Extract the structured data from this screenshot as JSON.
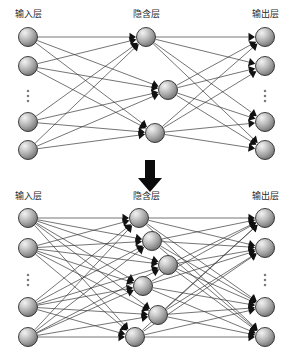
{
  "figure": {
    "background_color": "#ffffff",
    "node_fill_color": "#9e9e9e",
    "node_highlight_color": "#e8e8e8",
    "node_stroke_color": "#2a2a2a",
    "edge_color": "#3a3a3a",
    "arrow_color": "#111111",
    "label_color": "#2b2b2b"
  },
  "labels": {
    "input_layer": "输入层",
    "hidden_layer": "隐含层",
    "output_layer": "输出层",
    "ellipsis": "⋮"
  },
  "transition": {
    "icon": "down-arrow-icon",
    "direction": "down"
  },
  "chart_data": {
    "type": "diagram",
    "panels": [
      {
        "name": "top-network",
        "caption": "Network before hidden-node expansion",
        "layers": [
          {
            "name": "input",
            "label": "输点层",
            "label_text": "输入层",
            "node_count_shown": 4,
            "has_ellipsis": true,
            "nodes": [
              {
                "id": "t-in-1",
                "cx": 28,
                "cy": 37
              },
              {
                "id": "t-in-2",
                "cx": 28,
                "cy": 66
              },
              {
                "id": "t-in-3",
                "cx": 28,
                "cy": 122
              },
              {
                "id": "t-in-4",
                "cx": 28,
                "cy": 150
              }
            ],
            "ellipsis": {
              "cx": 28,
              "cy": 96
            }
          },
          {
            "name": "hidden",
            "label_text": "隐含层",
            "node_count_shown": 3,
            "has_ellipsis": false,
            "nodes": [
              {
                "id": "t-hd-1",
                "cx": 146,
                "cy": 37
              },
              {
                "id": "t-hd-2",
                "cx": 168,
                "cy": 90
              },
              {
                "id": "t-hd-3",
                "cx": 155,
                "cy": 133
              }
            ]
          },
          {
            "name": "output",
            "label_text": "输出层",
            "node_count_shown": 4,
            "has_ellipsis": true,
            "nodes": [
              {
                "id": "t-ou-1",
                "cx": 265,
                "cy": 37
              },
              {
                "id": "t-ou-2",
                "cx": 265,
                "cy": 66
              },
              {
                "id": "t-ou-3",
                "cx": 265,
                "cy": 122
              },
              {
                "id": "t-ou-4",
                "cx": 265,
                "cy": 150
              }
            ],
            "ellipsis": {
              "cx": 265,
              "cy": 96
            }
          }
        ],
        "connectivity": "fully-connected-input-to-hidden-and-hidden-to-output"
      },
      {
        "name": "bottom-network",
        "caption": "Network after hidden-node expansion",
        "layers": [
          {
            "name": "input",
            "label_text": "输入层",
            "node_count_shown": 4,
            "has_ellipsis": true,
            "nodes": [
              {
                "id": "b-in-1",
                "cx": 28,
                "cy": 218
              },
              {
                "id": "b-in-2",
                "cx": 28,
                "cy": 248
              },
              {
                "id": "b-in-3",
                "cx": 28,
                "cy": 307
              },
              {
                "id": "b-in-4",
                "cx": 28,
                "cy": 337
              }
            ],
            "ellipsis": {
              "cx": 28,
              "cy": 280
            }
          },
          {
            "name": "hidden",
            "label_text": "隐含层",
            "node_count_shown": 6,
            "has_ellipsis": false,
            "nodes": [
              {
                "id": "b-hd-1",
                "cx": 139,
                "cy": 218
              },
              {
                "id": "b-hd-2",
                "cx": 152,
                "cy": 241
              },
              {
                "id": "b-hd-3",
                "cx": 168,
                "cy": 265
              },
              {
                "id": "b-hd-4",
                "cx": 143,
                "cy": 286
              },
              {
                "id": "b-hd-5",
                "cx": 158,
                "cy": 315
              },
              {
                "id": "b-hd-6",
                "cx": 135,
                "cy": 337
              }
            ]
          },
          {
            "name": "output",
            "label_text": "输出层",
            "node_count_shown": 4,
            "has_ellipsis": true,
            "nodes": [
              {
                "id": "b-ou-1",
                "cx": 265,
                "cy": 218
              },
              {
                "id": "b-ou-2",
                "cx": 265,
                "cy": 248
              },
              {
                "id": "b-ou-3",
                "cx": 265,
                "cy": 307
              },
              {
                "id": "b-ou-4",
                "cx": 265,
                "cy": 337
              }
            ],
            "ellipsis": {
              "cx": 265,
              "cy": 280
            }
          }
        ],
        "connectivity": "fully-connected-input-to-hidden-and-hidden-to-output"
      }
    ],
    "node_radius": 9.5,
    "annotations": [
      {
        "type": "arrow",
        "name": "transition-arrow",
        "x": 150,
        "y_from": 160,
        "y_to": 192,
        "direction": "down"
      }
    ],
    "label_positions": {
      "top": [
        {
          "text": "输入层",
          "x": 28,
          "y": 14
        },
        {
          "text": "隐含层",
          "x": 146,
          "y": 14
        },
        {
          "text": "输出层",
          "x": 265,
          "y": 14
        }
      ],
      "bottom": [
        {
          "text": "输入层",
          "x": 28,
          "y": 196
        },
        {
          "text": "隐含层",
          "x": 146,
          "y": 196
        },
        {
          "text": "输出层",
          "x": 265,
          "y": 196
        }
      ]
    }
  }
}
